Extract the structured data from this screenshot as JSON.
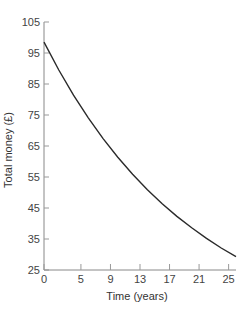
{
  "chart_data": {
    "type": "line",
    "title": "",
    "xlabel": "Time (years)",
    "ylabel": "Total money (£)",
    "xlim": [
      0,
      26
    ],
    "ylim": [
      25,
      105
    ],
    "x_ticks": [
      0,
      5,
      9,
      13,
      17,
      21,
      25
    ],
    "y_ticks": [
      25,
      35,
      45,
      55,
      65,
      75,
      85,
      95,
      105
    ],
    "grid": false,
    "legend": null,
    "series": [
      {
        "name": "Total money",
        "color": "#2a2a2a",
        "x": [
          0,
          2,
          4,
          6,
          8,
          10,
          12,
          14,
          16,
          18,
          20,
          22,
          24,
          26
        ],
        "y": [
          98.5,
          89.5,
          81.4,
          74.1,
          67.4,
          61.4,
          55.9,
          50.9,
          46.4,
          42.3,
          38.6,
          35.2,
          32.1,
          29.3
        ]
      }
    ]
  }
}
